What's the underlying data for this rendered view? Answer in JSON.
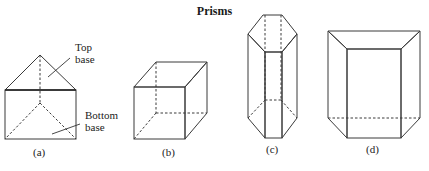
{
  "title": "Prisms",
  "colors": {
    "face_light": "#c9c9c9",
    "face_mid": "#b3b3b3",
    "face_dark": "#9a9a9a",
    "edge": "#3a3a3a",
    "text": "#222222"
  },
  "figures": [
    {
      "id": "a",
      "caption": "(a)",
      "shape": "triangular prism",
      "annotations": [
        {
          "line1": "Top",
          "line2": "base"
        },
        {
          "line1": "Bottom",
          "line2": "base"
        }
      ]
    },
    {
      "id": "b",
      "caption": "(b)",
      "shape": "rectangular prism (cube)"
    },
    {
      "id": "c",
      "caption": "(c)",
      "shape": "hexagonal prism"
    },
    {
      "id": "d",
      "caption": "(d)",
      "shape": "trapezoidal prism"
    }
  ]
}
